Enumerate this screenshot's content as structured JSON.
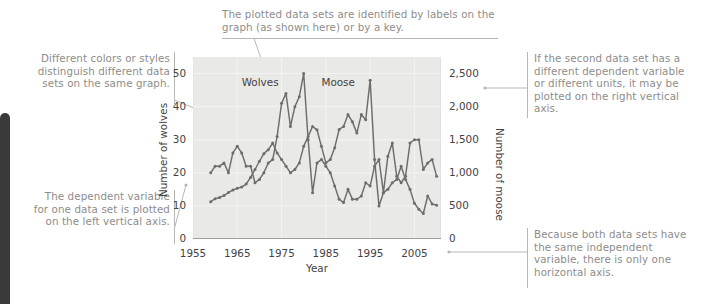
{
  "figure": {
    "left_bar": "page-edge-bar"
  },
  "notes": {
    "top": "The plotted data sets are identified by labels on the graph (as shown here) or by a key.",
    "left_upper": "Different colors or styles distinguish different data sets on the same graph.",
    "left_lower": "The dependent variable for one data set is plotted on the left vertical axis.",
    "right_upper": "If the second data set has a different dependent variable or different units, it may be plotted on the right vertical axis.",
    "right_lower": "Because both data sets have the same independent variable, there is only one horizontal axis."
  },
  "chart_data": {
    "type": "line",
    "title": "",
    "xlabel": "Year",
    "ylabel": "Number of wolves",
    "y2label": "Number of moose",
    "grid": true,
    "legend_position": "in-plot-labels",
    "xlim": [
      1955,
      2011
    ],
    "xticks": [
      "1955",
      "1965",
      "1975",
      "1985",
      "1995",
      "2005"
    ],
    "xtick_values": [
      1955,
      1965,
      1975,
      1985,
      1995,
      2005
    ],
    "ylim": [
      0,
      55
    ],
    "yticks": [
      "0",
      "10",
      "20",
      "30",
      "40",
      "50"
    ],
    "ytick_values": [
      0,
      10,
      20,
      30,
      40,
      50
    ],
    "y2lim": [
      0,
      2750
    ],
    "y2ticks": [
      "0",
      "500",
      "1,000",
      "1,500",
      "2,000",
      "2,500"
    ],
    "y2tick_values": [
      0,
      500,
      1000,
      1500,
      2000,
      2500
    ],
    "x": [
      1959,
      1960,
      1961,
      1962,
      1963,
      1964,
      1965,
      1966,
      1967,
      1968,
      1969,
      1970,
      1971,
      1972,
      1973,
      1974,
      1975,
      1976,
      1977,
      1978,
      1979,
      1980,
      1981,
      1982,
      1983,
      1984,
      1985,
      1986,
      1987,
      1988,
      1989,
      1990,
      1991,
      1992,
      1993,
      1994,
      1995,
      1996,
      1997,
      1998,
      1999,
      2000,
      2001,
      2002,
      2003,
      2004,
      2005,
      2006,
      2007,
      2008,
      2009,
      2010
    ],
    "series": [
      {
        "name": "Wolves",
        "axis": "left",
        "color": "#6f6d6b",
        "values": [
          20,
          22,
          22,
          23,
          20,
          26,
          28,
          26,
          22,
          22,
          17,
          18,
          20,
          23,
          24,
          31,
          41,
          44,
          34,
          40,
          43,
          50,
          30,
          14,
          23,
          24,
          22,
          20,
          16,
          12,
          11,
          15,
          12,
          12,
          13,
          17,
          16,
          22,
          24,
          14,
          25,
          29,
          19,
          17,
          19,
          29,
          30,
          30,
          21,
          23,
          24,
          19
        ]
      },
      {
        "name": "Moose",
        "axis": "right",
        "color": "#6f6d6b",
        "values": [
          563,
          610,
          628,
          656,
          703,
          740,
          765,
          785,
          830,
          930,
          1050,
          1175,
          1290,
          1350,
          1450,
          1300,
          1200,
          1100,
          1000,
          1050,
          1150,
          1400,
          1550,
          1700,
          1650,
          1400,
          1150,
          1200,
          1380,
          1655,
          1700,
          1880,
          1770,
          1600,
          1880,
          1800,
          2400,
          1200,
          500,
          700,
          750,
          850,
          900,
          1100,
          900,
          750,
          540,
          450,
          385,
          650,
          530,
          510
        ]
      }
    ],
    "annotations": [
      {
        "text": "Wolves",
        "x": 1966,
        "y": 47
      },
      {
        "text": "Moose",
        "x": 1984,
        "y": 47
      }
    ]
  }
}
